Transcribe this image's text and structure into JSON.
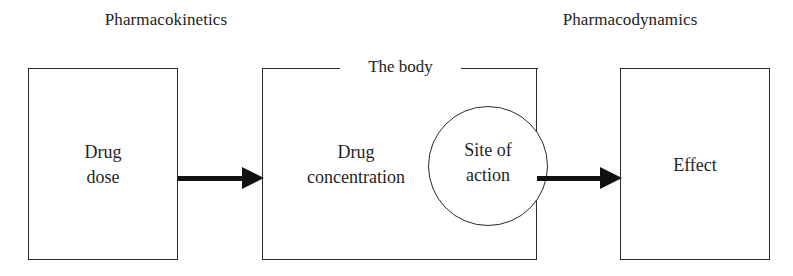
{
  "diagram": {
    "headers": {
      "pharmacokinetics": "Pharmacokinetics",
      "pharmacodynamics": "Pharmacodynamics"
    },
    "boxes": {
      "drug_dose": "Drug\ndose",
      "drug_concentration": "Drug\nconcentration",
      "effect": "Effect"
    },
    "body_legend": "The body",
    "circle": {
      "site_of_action": "Site of\naction"
    },
    "colors": {
      "stroke": "#2b2b2b",
      "arrow": "#111111",
      "text": "#1f1f1f",
      "background": "#ffffff"
    }
  }
}
